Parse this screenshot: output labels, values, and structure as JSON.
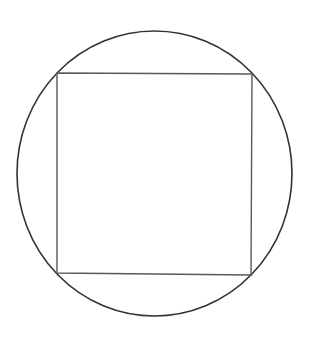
{
  "diagram": {
    "canvas": {
      "width": 315,
      "height": 337,
      "background": "#ffffff"
    },
    "circle": {
      "cx": 154.5,
      "cy": 173.5,
      "rx": 137.5,
      "ry": 142.5,
      "stroke": "#333333",
      "stroke_width": 1.6
    },
    "square": {
      "points": [
        [
          57,
          73
        ],
        [
          252,
          74
        ],
        [
          251,
          275
        ],
        [
          57,
          273
        ]
      ],
      "stroke": "#5a5a5a",
      "stroke_width": 1.4
    }
  }
}
